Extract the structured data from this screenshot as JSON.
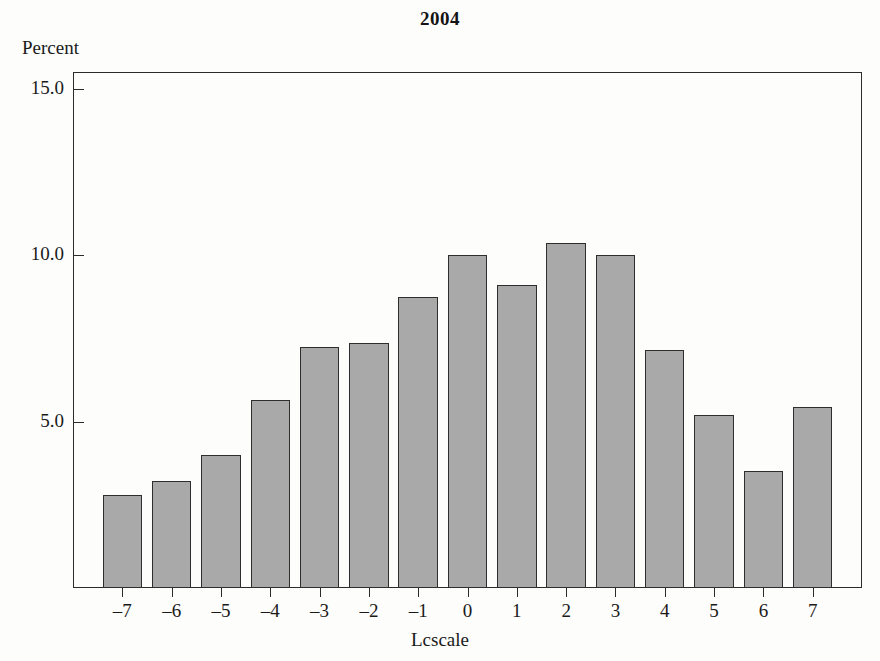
{
  "chart_data": {
    "type": "bar",
    "title": "2004",
    "xlabel": "Lcscale",
    "ylabel": "Percent",
    "categories": [
      "–7",
      "–6",
      "–5",
      "–4",
      "–3",
      "–2",
      "–1",
      "0",
      "1",
      "2",
      "3",
      "4",
      "5",
      "6",
      "7"
    ],
    "values": [
      2.8,
      3.2,
      4.0,
      5.65,
      7.25,
      7.35,
      8.75,
      10.0,
      9.1,
      10.35,
      10.0,
      7.15,
      5.2,
      3.5,
      5.45
    ],
    "ylim": [
      0,
      15.5
    ],
    "yticks": [
      5.0,
      10.0,
      15.0
    ],
    "ytick_labels": [
      "5.0",
      "10.0",
      "15.0"
    ],
    "grid": false,
    "legend": "none",
    "bar_color": "#a9a9a9",
    "bar_edge_color": "#2e2e2e",
    "axis_color": "#2b2b2b"
  }
}
